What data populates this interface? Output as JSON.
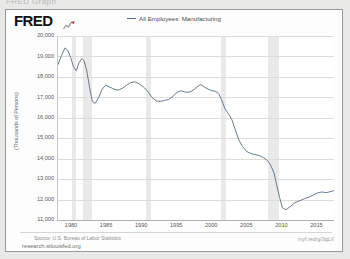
{
  "page": {
    "clipped_text_above": "FRED Graph"
  },
  "header": {
    "logo_text": "FRED",
    "logo_glyph": "chart-glyph"
  },
  "legend": {
    "items": [
      {
        "label": "All Employees: Manufacturing",
        "color": "#5b6b86"
      }
    ]
  },
  "footer": {
    "source": "Source: U.S. Bureau of Labor Statistics",
    "site_url": "research.stlouisfed.org",
    "shortlink": "myf.red/g/3qLV"
  },
  "colors": {
    "series": "#5b6b86",
    "recession_band": "#e9e9e9",
    "gridline": "#dcdcdc",
    "card_border": "#9a9a98",
    "page_background": "#e8e8e6"
  },
  "chart_data": {
    "type": "line",
    "title": "",
    "xlabel": "",
    "ylabel": "(Thousands of Persons)",
    "xlim": [
      1978.0,
      2017.5
    ],
    "ylim": [
      11000,
      20000
    ],
    "yticks": [
      11000,
      12000,
      13000,
      14000,
      15000,
      16000,
      17000,
      18000,
      19000,
      20000
    ],
    "ytick_labels": [
      "11,000",
      "12,000",
      "13,000",
      "14,000",
      "15,000",
      "16,000",
      "17,000",
      "18,000",
      "19,000",
      "20,000"
    ],
    "xticks": [
      1980,
      1985,
      1990,
      1995,
      2000,
      2005,
      2010,
      2015
    ],
    "xtick_labels": [
      "1980",
      "1985",
      "1990",
      "1995",
      "2000",
      "2005",
      "2010",
      "2015"
    ],
    "grid": true,
    "legend_position": "top-center",
    "recession_bands": [
      {
        "start": 1980.0,
        "end": 1980.55
      },
      {
        "start": 1981.55,
        "end": 1982.9
      },
      {
        "start": 1990.55,
        "end": 1991.2
      },
      {
        "start": 2001.2,
        "end": 2001.9
      },
      {
        "start": 2007.95,
        "end": 2009.45
      }
    ],
    "series": [
      {
        "name": "All Employees: Manufacturing",
        "color": "#5b6b86",
        "units": "Thousands of Persons",
        "x": [
          1978.0,
          1978.5,
          1979.0,
          1979.4,
          1979.8,
          1980.2,
          1980.6,
          1981.0,
          1981.4,
          1981.7,
          1982.1,
          1982.5,
          1982.9,
          1983.3,
          1983.8,
          1984.3,
          1984.8,
          1985.4,
          1986.0,
          1986.6,
          1987.2,
          1987.8,
          1988.4,
          1989.0,
          1989.6,
          1990.2,
          1990.8,
          1991.4,
          1992.0,
          1992.6,
          1993.2,
          1993.8,
          1994.4,
          1995.0,
          1995.6,
          1996.2,
          1996.8,
          1997.4,
          1998.0,
          1998.4,
          1998.9,
          1999.4,
          1999.9,
          2000.4,
          2000.9,
          2001.3,
          2001.8,
          2002.3,
          2002.8,
          2003.3,
          2003.8,
          2004.3,
          2004.9,
          2005.5,
          2006.1,
          2006.7,
          2007.3,
          2007.9,
          2008.3,
          2008.8,
          2009.2,
          2009.6,
          2010.0,
          2010.5,
          2011.1,
          2011.8,
          2012.5,
          2013.2,
          2014.0,
          2014.8,
          2015.6,
          2016.3,
          2017.0,
          2017.4
        ],
        "y": [
          18600,
          19050,
          19420,
          19300,
          18950,
          18500,
          18300,
          18700,
          18900,
          18800,
          18300,
          17500,
          16800,
          16700,
          17000,
          17400,
          17600,
          17500,
          17400,
          17350,
          17450,
          17600,
          17720,
          17760,
          17650,
          17500,
          17300,
          17000,
          16830,
          16800,
          16850,
          16900,
          17050,
          17250,
          17320,
          17250,
          17260,
          17380,
          17560,
          17620,
          17500,
          17400,
          17330,
          17300,
          17200,
          16900,
          16450,
          16200,
          15900,
          15400,
          14900,
          14600,
          14350,
          14250,
          14200,
          14150,
          14050,
          13900,
          13700,
          13300,
          12700,
          12100,
          11600,
          11500,
          11650,
          11850,
          11950,
          12050,
          12150,
          12300,
          12370,
          12340,
          12400,
          12440
        ]
      }
    ]
  }
}
